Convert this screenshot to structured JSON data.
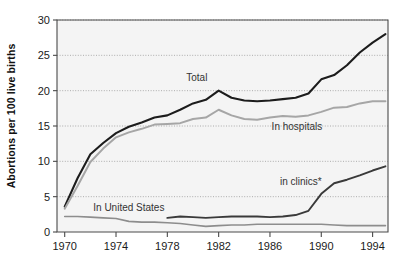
{
  "chart_data": {
    "type": "line",
    "title": "",
    "xlabel": "",
    "ylabel": "Abortions per 100 live births",
    "xlim": [
      1969.4,
      1995.2
    ],
    "ylim": [
      0,
      30
    ],
    "xticks": [
      1970,
      1974,
      1978,
      1982,
      1986,
      1990,
      1994
    ],
    "xtick_labels": [
      "1970",
      "1974",
      "1978",
      "1982",
      "1986",
      "1990",
      "1994"
    ],
    "yticks": [
      0,
      5,
      10,
      15,
      20,
      25,
      30
    ],
    "ytick_labels": [
      "0",
      "5",
      "10",
      "15",
      "20",
      "25",
      "30"
    ],
    "grid": "horizontal-dotted",
    "legend_position": "inline-annotations",
    "x": [
      1970,
      1971,
      1972,
      1973,
      1974,
      1975,
      1976,
      1977,
      1978,
      1979,
      1980,
      1981,
      1982,
      1983,
      1984,
      1985,
      1986,
      1987,
      1988,
      1989,
      1990,
      1991,
      1992,
      1993,
      1994,
      1995
    ],
    "series": [
      {
        "name": "Total",
        "label": "Total",
        "color": "#1c1c1c",
        "values": [
          3.6,
          7.6,
          11.0,
          12.6,
          14.0,
          14.9,
          15.5,
          16.2,
          16.5,
          17.3,
          18.2,
          18.7,
          20.0,
          19.0,
          18.6,
          18.5,
          18.6,
          18.8,
          19.0,
          19.6,
          21.6,
          22.2,
          23.6,
          25.4,
          26.8,
          28.0
        ]
      },
      {
        "name": "In hospitals",
        "label": "In hospitals",
        "color": "#a6a6a6",
        "values": [
          3.3,
          6.5,
          9.9,
          11.8,
          13.4,
          14.1,
          14.6,
          15.2,
          15.3,
          15.4,
          16.0,
          16.2,
          17.3,
          16.5,
          16.0,
          15.9,
          16.2,
          16.4,
          16.3,
          16.5,
          17.0,
          17.6,
          17.7,
          18.2,
          18.5,
          18.5
        ]
      },
      {
        "name": "in clinics*",
        "label": "in clinics*",
        "color": "#3a3a3a",
        "values": [
          null,
          null,
          null,
          null,
          null,
          null,
          null,
          null,
          2.0,
          2.2,
          2.1,
          2.0,
          2.1,
          2.2,
          2.2,
          2.2,
          2.1,
          2.2,
          2.4,
          3.0,
          5.4,
          6.9,
          7.4,
          8.0,
          8.7,
          9.3
        ]
      },
      {
        "name": "In United States",
        "label": "In United States",
        "color": "#8d8d8d",
        "values": [
          2.2,
          2.2,
          2.1,
          2.0,
          1.9,
          1.5,
          1.4,
          1.4,
          1.3,
          1.2,
          1.0,
          0.8,
          0.9,
          1.0,
          1.0,
          1.1,
          1.1,
          1.1,
          1.1,
          1.1,
          1.1,
          1.0,
          0.9,
          0.9,
          0.9,
          0.9
        ]
      }
    ],
    "annotations": [
      {
        "text": "Total",
        "x": 1980.3,
        "y": 21.4
      },
      {
        "text": "In hospitals",
        "x": 1988.1,
        "y": 14.5
      },
      {
        "text": "in clinics*",
        "x": 1988.4,
        "y": 6.6
      },
      {
        "text": "In United States",
        "x": 1975.0,
        "y": 3.0
      }
    ]
  },
  "colors": {
    "total": "#1c1c1c",
    "hospitals": "#a6a6a6",
    "clinics": "#3a3a3a",
    "united_states": "#8d8d8d",
    "plot_background": "#f4f4f4",
    "grid": "#9a9a9a",
    "axis": "#4a4a4a"
  }
}
